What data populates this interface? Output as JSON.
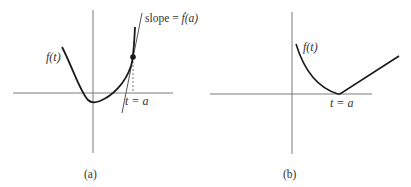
{
  "panels": [
    {
      "id": "a",
      "caption": "(a)",
      "function_label": "f(t)",
      "slope_label": "slope = ",
      "slope_fn": "ḟ(a)",
      "point_label": "t = a",
      "description": "Smooth function f(t) with tangent line at t = a"
    },
    {
      "id": "b",
      "caption": "(b)",
      "function_label": "f(t)",
      "point_label": "t = a",
      "description": "Function f(t) with a corner (non-differentiable point) at t = a"
    }
  ],
  "colors": {
    "axis": "#7a7a7a",
    "curve": "#1a1a1a",
    "text": "#333333"
  }
}
